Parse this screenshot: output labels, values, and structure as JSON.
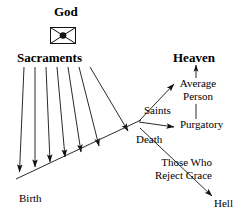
{
  "diagram": {
    "title_god": "God",
    "god_symbol_name": "god-envelope-symbol",
    "labels": {
      "god": "God",
      "sacraments": "Sacraments",
      "heaven": "Heaven",
      "saints": "Saints",
      "average_person_line1": "Average",
      "average_person_line2": "Person",
      "purgatory": "Purgatory",
      "death": "Death",
      "reject_line1": "Those Who",
      "reject_line2": "Reject Grace",
      "hell": "Hell",
      "birth": "Birth"
    },
    "colors": {
      "ink": "#000000",
      "background": "#ffffff",
      "line": "#1a1a1a"
    },
    "nodes": [
      {
        "id": "god",
        "label": "God",
        "bold": true,
        "x": 66,
        "y": 7
      },
      {
        "id": "sacraments",
        "label": "Sacraments",
        "bold": true,
        "x": 18,
        "y": 52
      },
      {
        "id": "heaven",
        "label": "Heaven",
        "bold": true,
        "x": 176,
        "y": 52
      },
      {
        "id": "saints",
        "label": "Saints",
        "bold": false,
        "x": 148,
        "y": 104
      },
      {
        "id": "average-person",
        "label": "Average Person",
        "bold": false,
        "x": 182,
        "y": 80
      },
      {
        "id": "purgatory",
        "label": "Purgatory",
        "bold": false,
        "x": 178,
        "y": 123
      },
      {
        "id": "death",
        "label": "Death",
        "bold": false,
        "x": 140,
        "y": 136
      },
      {
        "id": "reject-grace",
        "label": "Those Who Reject Grace",
        "bold": false,
        "x": 176,
        "y": 160
      },
      {
        "id": "hell",
        "label": "Hell",
        "bold": false,
        "x": 216,
        "y": 202
      },
      {
        "id": "birth",
        "label": "Birth",
        "bold": false,
        "x": 20,
        "y": 195
      }
    ],
    "edges": [
      {
        "id": "sacrament-arrow-1",
        "from": "sacraments",
        "to": "lifeline"
      },
      {
        "id": "sacrament-arrow-2",
        "from": "sacraments",
        "to": "lifeline"
      },
      {
        "id": "sacrament-arrow-3",
        "from": "sacraments",
        "to": "lifeline"
      },
      {
        "id": "sacrament-arrow-4",
        "from": "sacraments",
        "to": "lifeline"
      },
      {
        "id": "sacrament-arrow-5",
        "from": "sacraments",
        "to": "lifeline"
      },
      {
        "id": "sacrament-arrow-6",
        "from": "sacraments",
        "to": "lifeline"
      },
      {
        "id": "sacrament-arrow-7",
        "from": "sacraments",
        "to": "lifeline"
      },
      {
        "id": "lifeline",
        "from": "birth",
        "to": "death"
      },
      {
        "id": "saints-to-heaven",
        "from": "death",
        "to": "heaven"
      },
      {
        "id": "death-to-purgatory",
        "from": "death",
        "to": "purgatory"
      },
      {
        "id": "purgatory-to-average-person",
        "from": "purgatory",
        "to": "average-person"
      },
      {
        "id": "average-person-to-heaven",
        "from": "average-person",
        "to": "heaven"
      },
      {
        "id": "death-to-hell",
        "from": "death",
        "to": "hell"
      }
    ]
  }
}
